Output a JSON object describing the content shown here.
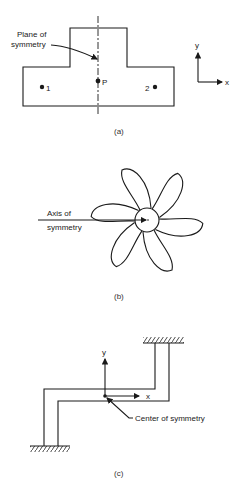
{
  "figure_a": {
    "caption": "(a)",
    "plane_label_line1": "Plane of",
    "plane_label_line2": "symmetry",
    "point_p": "P",
    "point_1": "1",
    "point_2": "2",
    "axis_x": "x",
    "axis_y": "y"
  },
  "figure_b": {
    "caption": "(b)",
    "axis_label_line1": "Axis of",
    "axis_label_line2": "symmetry",
    "blade_count": 6
  },
  "figure_c": {
    "caption": "(c)",
    "center_label": "Center of symmetry",
    "axis_x": "x",
    "axis_y": "y"
  },
  "colors": {
    "line": "#1a1a1a",
    "background": "#ffffff"
  }
}
